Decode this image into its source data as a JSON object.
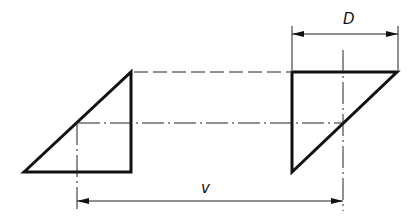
{
  "diagram": {
    "type": "technical-projection-drawing",
    "labels": {
      "D": "D",
      "v": "v"
    },
    "shapes": {
      "left_triangle": {
        "points": [
          [
            24,
            172
          ],
          [
            131,
            72
          ],
          [
            131,
            172
          ]
        ]
      },
      "right_triangle": {
        "points": [
          [
            292,
            72
          ],
          [
            397,
            72
          ],
          [
            292,
            172
          ]
        ]
      }
    },
    "dimensions": [
      {
        "name": "D",
        "from_x": 292,
        "to_x": 398,
        "y": 34
      },
      {
        "name": "v",
        "from_x": 77,
        "to_x": 343,
        "y": 201
      }
    ],
    "colors": {
      "line": "#111111",
      "background": "#ffffff"
    }
  }
}
